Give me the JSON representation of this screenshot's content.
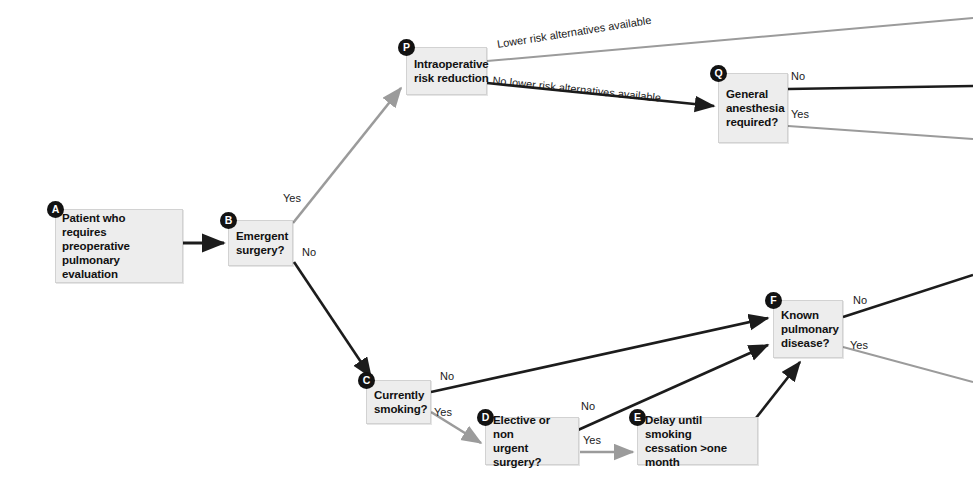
{
  "diagram": {
    "colors": {
      "background": "#ffffff",
      "node_fill": "#ededed",
      "node_border": "#d2d2d2",
      "badge_fill": "#121212",
      "edge_dark": "#1c1c1c",
      "edge_gray": "#9b9b9b",
      "text": "#111111"
    },
    "nodes": [
      {
        "id": "A",
        "badge": "A",
        "label": "Patient who\nrequires preoperative\npulmonary evaluation"
      },
      {
        "id": "B",
        "badge": "B",
        "label": "Emergent\nsurgery?"
      },
      {
        "id": "P",
        "badge": "P",
        "label": "Intraoperative\nrisk reduction"
      },
      {
        "id": "Q",
        "badge": "Q",
        "label": "General\nanesthesia\nrequired?"
      },
      {
        "id": "C",
        "badge": "C",
        "label": "Currently\nsmoking?"
      },
      {
        "id": "D",
        "badge": "D",
        "label": "Elective or non\nurgent surgery?"
      },
      {
        "id": "E",
        "badge": "E",
        "label": "Delay until smoking\ncessation >one month"
      },
      {
        "id": "F",
        "badge": "F",
        "label": "Known\npulmonary\ndisease?"
      }
    ],
    "edge_labels": {
      "b_yes": "Yes",
      "b_no": "No",
      "p_lower_risk": "Lower risk  alternatives available",
      "p_no_lower_risk": "No lower risk alternatives available",
      "q_no": "No",
      "q_yes": "Yes",
      "c_no": "No",
      "c_yes": "Yes",
      "d_no": "No",
      "d_yes": "Yes",
      "f_no": "No",
      "f_yes": "Yes"
    }
  }
}
